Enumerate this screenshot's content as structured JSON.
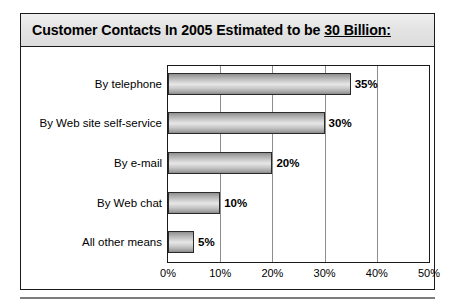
{
  "title": {
    "prefix": "Customer Contacts In 2005 Estimated to be ",
    "emphasis": "30 Billion:",
    "full": "Customer Contacts In 2005 Estimated to be 30 Billion:"
  },
  "chart_data": {
    "type": "bar",
    "orientation": "horizontal",
    "title": "Customer Contacts In 2005 Estimated to be 30 Billion:",
    "categories": [
      "By telephone",
      "By Web site self-service",
      "By e-mail",
      "By Web chat",
      "All other means"
    ],
    "values": [
      35,
      30,
      20,
      10,
      5
    ],
    "value_labels": [
      "35%",
      "30%",
      "20%",
      "10%",
      "5%"
    ],
    "xlabel": "",
    "ylabel": "",
    "xlim": [
      0,
      50
    ],
    "xticks": [
      0,
      10,
      20,
      30,
      40,
      50
    ],
    "xtick_labels": [
      "0%",
      "10%",
      "20%",
      "30%",
      "40%",
      "50%"
    ],
    "grid": "vertical",
    "legend": "none",
    "bar_color": "#cccccc",
    "bar_edge_color": "#2a2a2a",
    "background": "#ffffff",
    "title_band_color": "#e4e4e4"
  }
}
